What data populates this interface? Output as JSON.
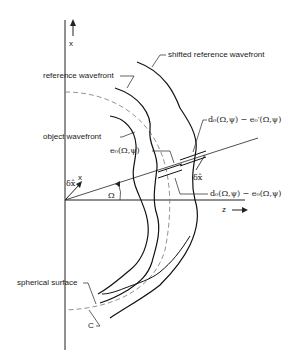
{
  "diagram": {
    "axes": {
      "x_label": "x",
      "z_label": "z",
      "angle_label": "Ω",
      "unit_vector_label": "δx̂",
      "unit_vector_axis": "x"
    },
    "labels": {
      "shifted_reference_wavefront": "shifted reference wavefront",
      "reference_wavefront": "reference wavefront",
      "object_wavefront": "object wavefront",
      "spherical_surface": "spherical surface",
      "c_label": "C",
      "e0": "e₀(Ω,ψ)",
      "d0_minus_e0_prime": "d₀(Ω,ψ) − e₀′(Ω,ψ)",
      "d0_minus_e0": "d₀(Ω,ψ) − e₀(Ω,ψ)",
      "delta_x_hat": "δx̂"
    }
  }
}
